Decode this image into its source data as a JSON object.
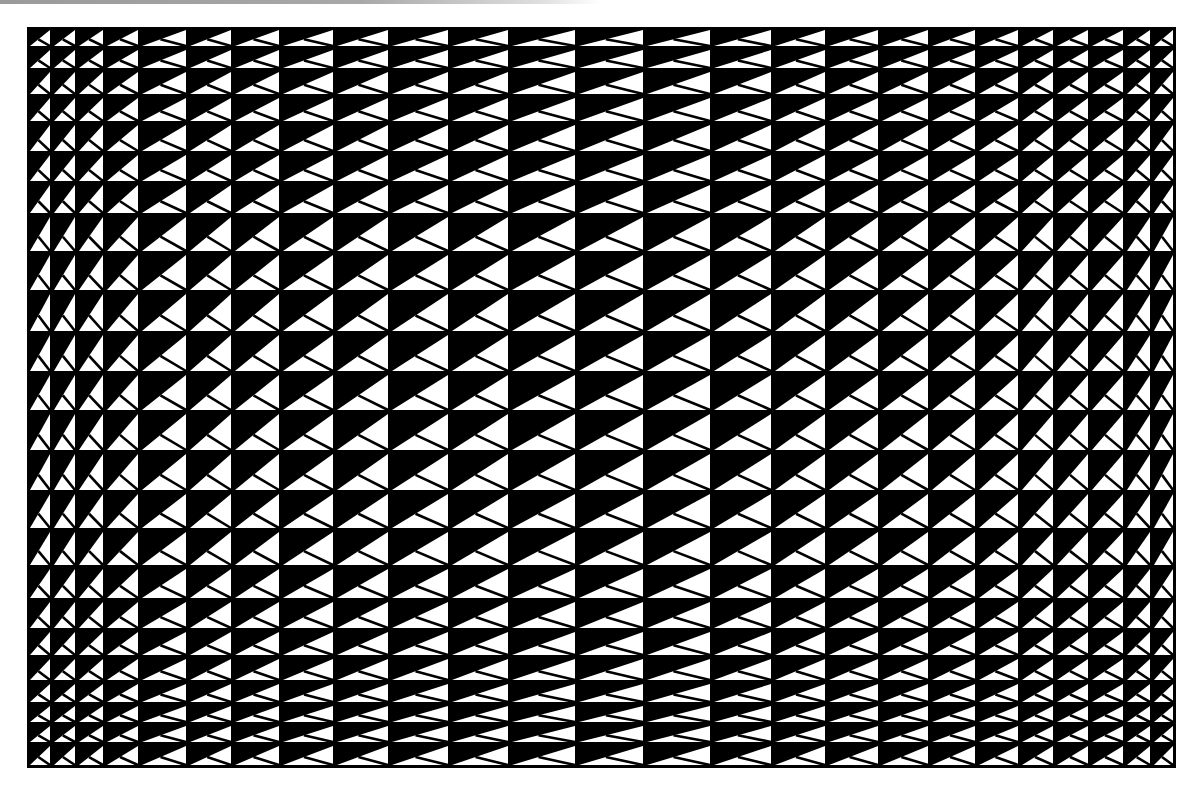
{
  "artwork": {
    "title": "Op-art triangle grid",
    "colors": {
      "background": "#ffffff",
      "ink": "#000000",
      "paper": "#ffffff",
      "scan_band": "#a0a0a0"
    },
    "frame": {
      "left": 28,
      "top": 28,
      "right": 1175,
      "bottom": 767
    },
    "column_edges": [
      28,
      52,
      77,
      105,
      140,
      188,
      233,
      281,
      335,
      390,
      450,
      510,
      577,
      645,
      712,
      773,
      827,
      880,
      930,
      977,
      1020,
      1055,
      1090,
      1125,
      1152,
      1175
    ],
    "row_edges": [
      28,
      48,
      70,
      96,
      123,
      153,
      183,
      215,
      253,
      292,
      333,
      373,
      412,
      452,
      492,
      530,
      567,
      600,
      630,
      657,
      682,
      704,
      724,
      744,
      767
    ],
    "cell": {
      "inset": 2,
      "split_line_anchor": 0.42,
      "split_line_width": 2.6
    }
  }
}
